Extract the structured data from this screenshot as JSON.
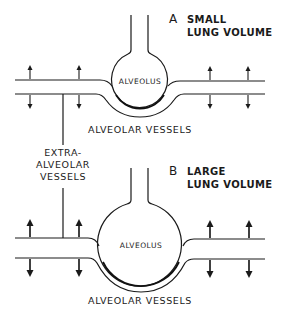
{
  "figure": {
    "panel_a": {
      "letter": "A",
      "title_line1": "SMALL",
      "title_line2": "LUNG VOLUME",
      "alveolus_label": "ALVEOLUS",
      "vessels_label": "ALVEOLAR VESSELS"
    },
    "panel_b": {
      "letter": "B",
      "title_line1": "LARGE",
      "title_line2": "LUNG VOLUME",
      "alveolus_label": "ALVEOLUS",
      "vessels_label": "ALVEOLAR VESSELS"
    },
    "extra_alveolar": {
      "line1": "EXTRA-",
      "line2": "ALVEOLAR",
      "line3": "VESSELS"
    },
    "colors": {
      "ink": "#1a1a1a",
      "background": "#ffffff"
    }
  }
}
